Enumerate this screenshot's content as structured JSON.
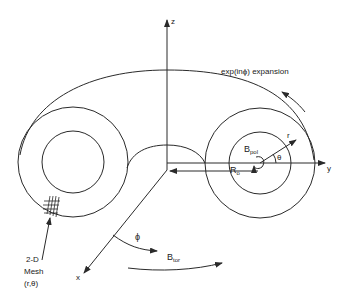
{
  "diagram": {
    "labels": {
      "z_axis": "z",
      "y_axis": "y",
      "x_axis": "x",
      "expansion": "exp(inϕ) expansion",
      "b_pol_main": "B",
      "b_pol_sub": "pol",
      "r": "r",
      "theta": "θ",
      "r0_main": "R",
      "r0_sub": "o",
      "phi": "ϕ",
      "b_tor_main": "B",
      "b_tor_sub": "tor",
      "mesh_line1": "2-D",
      "mesh_line2": "Mesh",
      "mesh_line3": "(r,θ)"
    },
    "colors": {
      "stroke": "#2a2a2a",
      "background": "#ffffff"
    }
  }
}
